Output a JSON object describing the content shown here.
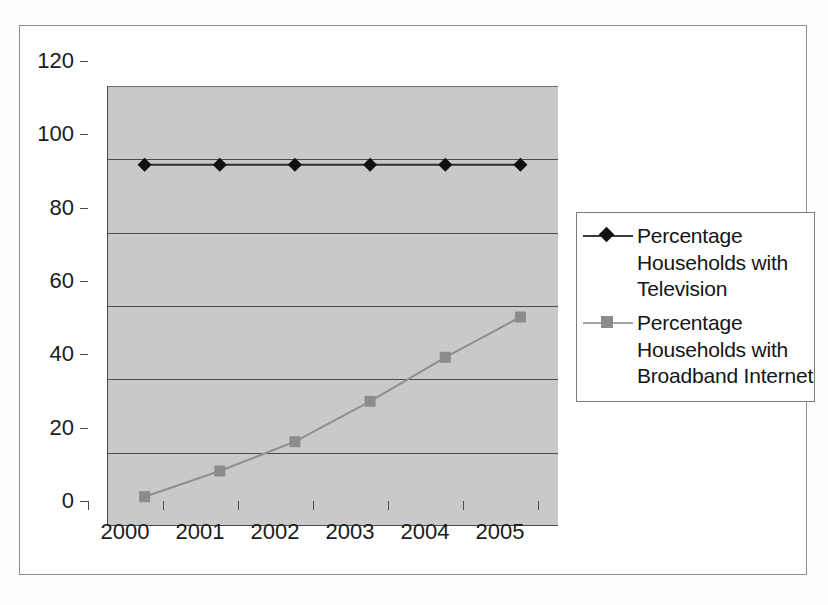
{
  "chart_data": {
    "type": "line",
    "title": "",
    "subtitle": "",
    "xlabel": "",
    "ylabel": "",
    "categories": [
      "2000",
      "2001",
      "2002",
      "2003",
      "2004",
      "2005"
    ],
    "x": [
      2000,
      2001,
      2002,
      2003,
      2004,
      2005
    ],
    "ylim": [
      0,
      120
    ],
    "ytick_interval": 20,
    "yticks": [
      "0",
      "20",
      "40",
      "60",
      "80",
      "100",
      "120"
    ],
    "grid": "horizontal",
    "legend_position": "right",
    "plot_background": "#c9c9c9",
    "series": [
      {
        "name": "Percentage Households with Television",
        "marker": "diamond",
        "color": "#111111",
        "values": [
          98.5,
          98.5,
          98.5,
          98.5,
          98.5,
          98.5
        ]
      },
      {
        "name": "Percentage Households with Broadband Internet",
        "marker": "square",
        "color": "#8c8c8c",
        "values": [
          8,
          15,
          23,
          34,
          46,
          57
        ]
      }
    ]
  },
  "legend": {
    "entries": [
      {
        "label_line_1": "Percentage",
        "label_line_2": "Households with",
        "label_line_3": "Television",
        "marker": "diamond-marker",
        "marker_color": "#111111",
        "line_color": "#3a3a3a"
      },
      {
        "label_line_1": "Percentage",
        "label_line_2": "Households with",
        "label_line_3": "Broadband Internet",
        "marker": "square-marker",
        "marker_color": "#8c8c8c",
        "line_color": "#a3a3a3"
      }
    ]
  },
  "axes": {
    "y_labels": [
      "120",
      "100",
      "80",
      "60",
      "40",
      "20",
      "0"
    ],
    "x_labels": [
      "2000",
      "2001",
      "2002",
      "2003",
      "2004",
      "2005"
    ]
  }
}
